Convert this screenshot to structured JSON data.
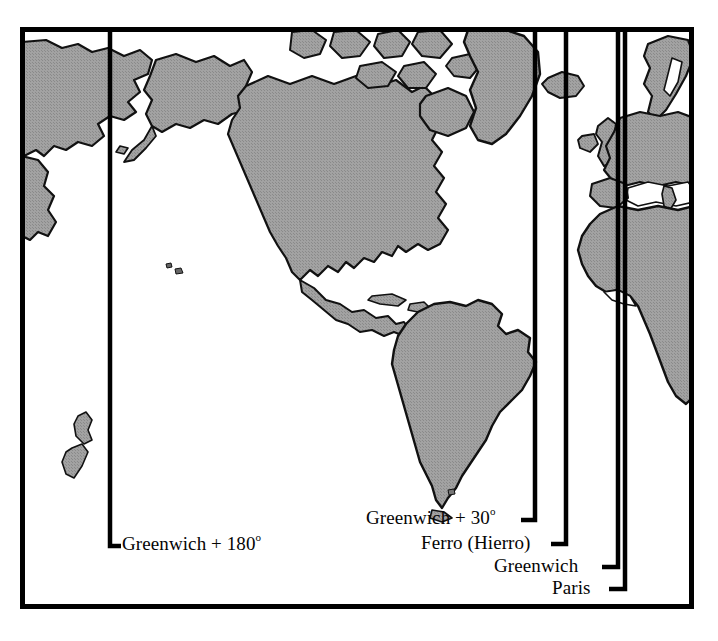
{
  "figure": {
    "kind": "world-map-diagram",
    "colors": {
      "land_fill": "#9a9a9a",
      "land_stroke": "#111111",
      "ocean_fill": "#ffffff",
      "line_color": "#000000",
      "frame_color": "#000000",
      "text_color": "#050505",
      "background": "#ffffff"
    },
    "frame": {
      "left": 20,
      "top": 27,
      "right": 694,
      "bottom": 608,
      "stroke_width": 5
    }
  },
  "meridians": [
    {
      "id": "greenwich-plus-180",
      "label": "Greenwich + 180",
      "degree_symbol": "o",
      "x": 110,
      "bend_y": 546,
      "leader_x": 121,
      "leader_side": "right"
    },
    {
      "id": "greenwich-plus-30",
      "label": "Greenwich + 30",
      "degree_symbol": "o",
      "x": 535,
      "bend_y": 520,
      "leader_x": 521,
      "leader_side": "left"
    },
    {
      "id": "ferro-hierro",
      "label": "Ferro (Hierro)",
      "degree_symbol": "",
      "x": 566,
      "bend_y": 544,
      "leader_x": 551,
      "leader_side": "left"
    },
    {
      "id": "greenwich",
      "label": "Greenwich",
      "degree_symbol": "",
      "x": 618,
      "bend_y": 567,
      "leader_x": 602,
      "leader_side": "left"
    },
    {
      "id": "paris",
      "label": "Paris",
      "degree_symbol": "",
      "x": 625,
      "bend_y": 589,
      "leader_x": 609,
      "leader_side": "left"
    }
  ],
  "landmasses": [
    "asia-northeast",
    "kamchatka",
    "north-america",
    "alaska",
    "canadian-arctic-archipelago",
    "greenland",
    "iceland",
    "british-isles",
    "scandinavia",
    "europe",
    "africa",
    "south-america",
    "central-america",
    "caribbean",
    "hawaii",
    "new-zealand",
    "falkland-islands",
    "tierra-del-fuego"
  ]
}
